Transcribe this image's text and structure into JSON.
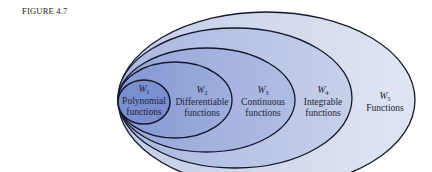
{
  "figure": {
    "label": "FIGURE 4.7"
  },
  "diagram": {
    "type": "nested-sets",
    "sets": [
      {
        "id": "W5",
        "symbol": "W",
        "subscript": "5",
        "line1": "Functions",
        "line2": "",
        "fill": "#d6ddee"
      },
      {
        "id": "W4",
        "symbol": "W",
        "subscript": "4",
        "line1": "Integrable",
        "line2": "functions",
        "fill": "#bcc7e5"
      },
      {
        "id": "W3",
        "symbol": "W",
        "subscript": "3",
        "line1": "Continuous",
        "line2": "functions",
        "fill": "#a3b1dd"
      },
      {
        "id": "W2",
        "symbol": "W",
        "subscript": "2",
        "line1": "Differentiable",
        "line2": "functions",
        "fill": "#8d9ed6"
      },
      {
        "id": "W1",
        "symbol": "W",
        "subscript": "1",
        "line1": "Polynomial",
        "line2": "functions",
        "fill": "#7b8fd0"
      }
    ],
    "relation": "W1 ⊂ W2 ⊂ W3 ⊂ W4 ⊂ W5",
    "stroke": "#15182a"
  }
}
